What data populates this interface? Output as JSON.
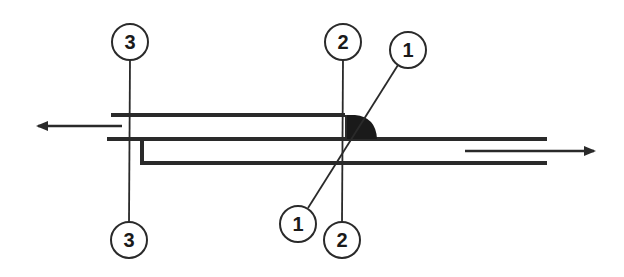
{
  "diagram": {
    "type": "weld-joint-section",
    "colors": {
      "line": "#2a2a2a",
      "weld": "#1a1a1a",
      "background": "#ffffff"
    },
    "callouts": [
      {
        "id": "callout-3-top",
        "label": "3",
        "cx": 130,
        "cy": 42,
        "r": 18
      },
      {
        "id": "callout-3-bottom",
        "label": "3",
        "cx": 129,
        "cy": 240,
        "r": 18
      },
      {
        "id": "callout-2-top",
        "label": "2",
        "cx": 343,
        "cy": 42,
        "r": 18
      },
      {
        "id": "callout-2-bottom",
        "label": "2",
        "cx": 342,
        "cy": 240,
        "r": 18
      },
      {
        "id": "callout-1-top",
        "label": "1",
        "cx": 408,
        "cy": 50,
        "r": 18
      },
      {
        "id": "callout-1-bottom",
        "label": "1",
        "cx": 298,
        "cy": 224,
        "r": 18
      }
    ],
    "arrows": [
      {
        "id": "flow-left",
        "direction": "left"
      },
      {
        "id": "flow-right",
        "direction": "right"
      }
    ]
  }
}
